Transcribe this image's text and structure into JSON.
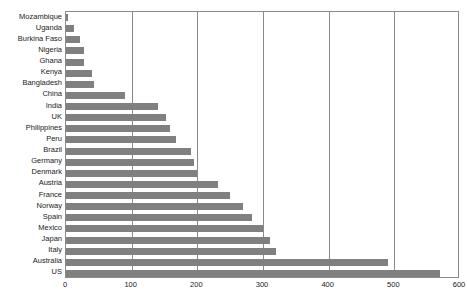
{
  "chart_data": {
    "type": "bar",
    "orientation": "horizontal",
    "title": "",
    "subtitle": "",
    "xlabel": "",
    "ylabel": "",
    "xlim": [
      0,
      600
    ],
    "ylim": null,
    "xticks": [
      0,
      100,
      200,
      300,
      400,
      500,
      600
    ],
    "xticklabels": [
      "0",
      "100",
      "200",
      "300",
      "400",
      "500",
      "600"
    ],
    "grid": "vertical",
    "legend": null,
    "legend_position": "none",
    "bar_color": "#808080",
    "axis_color": "#8a8a8a",
    "text_color": "#1a1a1a",
    "categories": [
      "Mozambique",
      "Uganda",
      "Burkina Faso",
      "Nigeria",
      "Ghana",
      "Kenya",
      "Bangladesh",
      "China",
      "India",
      "UK",
      "Philippines",
      "Peru",
      "Brazil",
      "Germany",
      "Denmark",
      "Austria",
      "France",
      "Norway",
      "Spain",
      "Mexico",
      "Japan",
      "Italy",
      "Australia",
      "US"
    ],
    "values": [
      3,
      12,
      22,
      28,
      28,
      40,
      42,
      90,
      140,
      152,
      158,
      168,
      190,
      195,
      200,
      232,
      250,
      270,
      283,
      300,
      310,
      320,
      490,
      570
    ]
  }
}
